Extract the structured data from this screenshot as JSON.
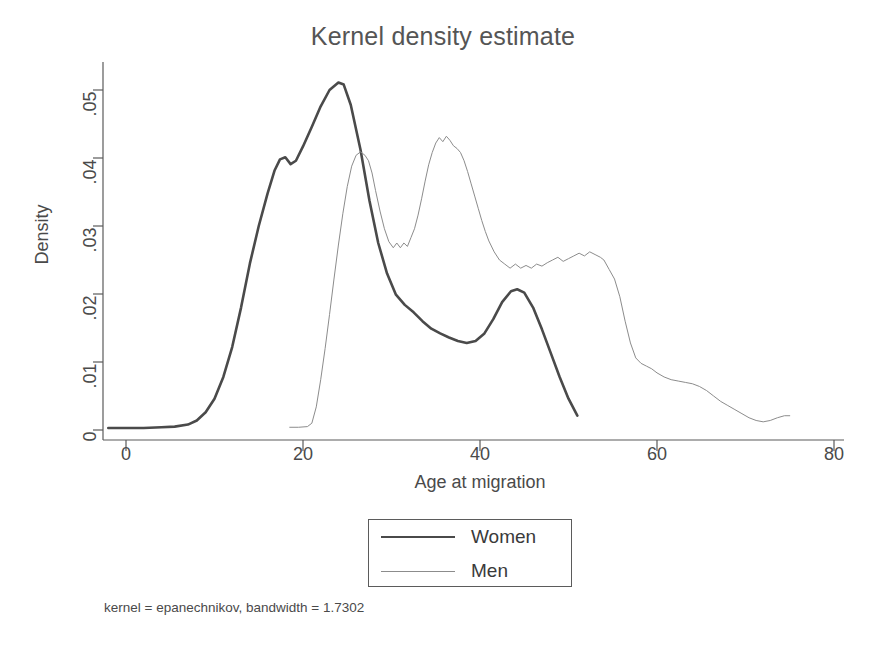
{
  "chart_data": {
    "type": "line",
    "title": "Kernel density estimate",
    "xlabel": "Age at migration",
    "ylabel": "Density",
    "xlim": [
      -4,
      84
    ],
    "ylim": [
      -0.0012,
      0.054
    ],
    "xticks": [
      0,
      20,
      40,
      60,
      80
    ],
    "xtick_labels": [
      "0",
      "20",
      "40",
      "60",
      "80"
    ],
    "yticks": [
      0,
      0.01,
      0.02,
      0.03,
      0.04,
      0.05
    ],
    "ytick_labels": [
      "0",
      ".01",
      ".02",
      ".03",
      ".04",
      ".05"
    ],
    "grid": false,
    "legend_position": "below-center",
    "note": "kernel = epanechnikov, bandwidth = 1.7302",
    "series": [
      {
        "name": "Women",
        "color": "#4a4a4a",
        "width": 2.6,
        "x": [
          -2.0,
          0.0,
          2.0,
          4.0,
          5.5,
          7.0,
          8.0,
          9.0,
          10.0,
          11.0,
          12.0,
          13.0,
          14.0,
          15.0,
          16.0,
          16.8,
          17.4,
          18.0,
          18.6,
          19.2,
          20.0,
          21.0,
          22.0,
          23.0,
          24.0,
          24.6,
          25.4,
          26.5,
          27.5,
          28.5,
          29.5,
          30.5,
          31.5,
          32.5,
          33.5,
          34.5,
          35.5,
          36.5,
          37.5,
          38.5,
          39.5,
          40.5,
          41.5,
          42.5,
          43.5,
          44.2,
          45.0,
          46.0,
          47.0,
          48.0,
          49.0,
          50.0,
          51.0
        ],
        "y": [
          0.0003,
          0.0003,
          0.0003,
          0.0004,
          0.0005,
          0.0008,
          0.0014,
          0.0026,
          0.0046,
          0.0078,
          0.0122,
          0.018,
          0.0245,
          0.03,
          0.0348,
          0.0382,
          0.0398,
          0.0401,
          0.0391,
          0.0396,
          0.0417,
          0.0446,
          0.0476,
          0.05,
          0.0511,
          0.0508,
          0.0478,
          0.0412,
          0.0338,
          0.0275,
          0.023,
          0.0199,
          0.0184,
          0.0173,
          0.016,
          0.0149,
          0.0142,
          0.0136,
          0.0131,
          0.0128,
          0.0131,
          0.0142,
          0.0163,
          0.0188,
          0.0204,
          0.0207,
          0.0202,
          0.018,
          0.0148,
          0.0113,
          0.0078,
          0.0046,
          0.0021
        ]
      },
      {
        "name": "Men",
        "color": "#8c8c8c",
        "width": 1.0,
        "x": [
          18.5,
          19.5,
          20.5,
          21.0,
          21.5,
          22.0,
          22.5,
          23.0,
          23.5,
          24.0,
          24.5,
          25.0,
          25.5,
          26.0,
          26.5,
          27.0,
          27.4,
          27.8,
          28.2,
          28.7,
          29.2,
          29.7,
          30.2,
          30.6,
          31.0,
          31.4,
          31.8,
          32.2,
          32.6,
          33.0,
          33.4,
          33.8,
          34.2,
          34.6,
          35.0,
          35.4,
          35.8,
          36.2,
          36.6,
          37.0,
          37.4,
          37.8,
          38.2,
          38.6,
          39.0,
          39.4,
          39.8,
          40.2,
          40.6,
          41.0,
          41.6,
          42.2,
          42.8,
          43.4,
          44.0,
          44.6,
          45.2,
          45.8,
          46.4,
          47.0,
          47.6,
          48.2,
          48.8,
          49.4,
          50.0,
          50.6,
          51.2,
          51.8,
          52.4,
          53.0,
          53.6,
          54.0,
          54.6,
          55.2,
          55.8,
          56.4,
          57.0,
          57.6,
          58.2,
          58.8,
          59.4,
          60.0,
          60.8,
          61.6,
          62.4,
          63.2,
          64.0,
          64.8,
          65.6,
          66.4,
          67.2,
          68.0,
          68.8,
          69.6,
          70.4,
          71.2,
          72.0,
          72.8,
          73.6,
          74.4,
          75.0
        ],
        "y": [
          0.0004,
          0.0004,
          0.0005,
          0.001,
          0.0034,
          0.0074,
          0.012,
          0.017,
          0.0222,
          0.0272,
          0.0318,
          0.0358,
          0.0388,
          0.0404,
          0.0409,
          0.0404,
          0.0396,
          0.0378,
          0.0352,
          0.0322,
          0.0296,
          0.0277,
          0.0268,
          0.0275,
          0.0268,
          0.0275,
          0.027,
          0.0283,
          0.0296,
          0.0316,
          0.034,
          0.0366,
          0.039,
          0.0408,
          0.0422,
          0.043,
          0.0424,
          0.0432,
          0.0426,
          0.0418,
          0.0414,
          0.0408,
          0.0396,
          0.038,
          0.0362,
          0.0344,
          0.0326,
          0.0308,
          0.0292,
          0.0278,
          0.0262,
          0.025,
          0.0244,
          0.0238,
          0.0244,
          0.0238,
          0.0242,
          0.0238,
          0.0244,
          0.0241,
          0.0246,
          0.025,
          0.0254,
          0.0248,
          0.0252,
          0.0256,
          0.026,
          0.0256,
          0.0262,
          0.0258,
          0.0254,
          0.025,
          0.0236,
          0.0222,
          0.0196,
          0.016,
          0.0128,
          0.0106,
          0.0098,
          0.0094,
          0.009,
          0.0084,
          0.0078,
          0.0074,
          0.0072,
          0.007,
          0.0068,
          0.0064,
          0.0058,
          0.005,
          0.0042,
          0.0036,
          0.003,
          0.0024,
          0.0018,
          0.0014,
          0.0012,
          0.0014,
          0.0018,
          0.0021,
          0.0021
        ]
      }
    ]
  },
  "legend": {
    "items": [
      {
        "label": "Women"
      },
      {
        "label": "Men"
      }
    ]
  }
}
